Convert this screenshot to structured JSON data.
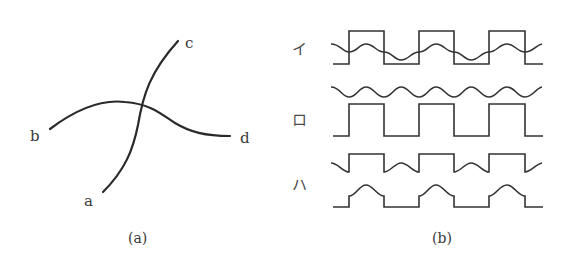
{
  "panel_a": {
    "caption": "(a)",
    "labels": {
      "a": "a",
      "b": "b",
      "c": "c",
      "d": "d"
    }
  },
  "panel_b": {
    "caption": "(b)",
    "rows": [
      {
        "label": "イ",
        "description": "square wave overlaid with sine wave crossing at transitions"
      },
      {
        "label": "ロ",
        "description": "sine wave above a square wave"
      },
      {
        "label": "ハ",
        "description": "square wave with sine dips on low segments, above a pulse train with sine bumps on high segments"
      }
    ]
  },
  "colors": {
    "stroke": "#2a2a2a",
    "background": "#ffffff"
  }
}
